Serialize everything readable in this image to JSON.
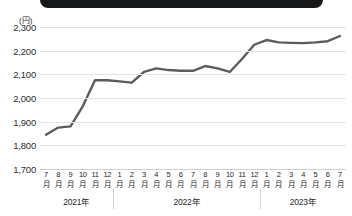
{
  "banner": {
    "name": "title-banner"
  },
  "chart_data": {
    "type": "line",
    "title": "",
    "xlabel": "",
    "ylabel": "",
    "unit_label": "(円)",
    "ylim": [
      1700,
      2300
    ],
    "ytick_step": 100,
    "yticks": [
      "2,300",
      "2,200",
      "2,100",
      "2,000",
      "1,900",
      "1,800",
      "1,700"
    ],
    "ytick_values": [
      2300,
      2200,
      2100,
      2000,
      1900,
      1800,
      1700
    ],
    "grid": true,
    "legend": "none",
    "month_suffix": "月",
    "categories": [
      "7月",
      "8月",
      "9月",
      "10月",
      "11月",
      "12月",
      "1月",
      "2月",
      "3月",
      "4月",
      "5月",
      "6月",
      "7月",
      "8月",
      "9月",
      "10月",
      "11月",
      "12月",
      "1月",
      "2月",
      "3月",
      "4月",
      "5月",
      "6月",
      "7月"
    ],
    "month_numbers": [
      "7",
      "8",
      "9",
      "10",
      "11",
      "12",
      "1",
      "2",
      "3",
      "4",
      "5",
      "6",
      "7",
      "8",
      "9",
      "10",
      "11",
      "12",
      "1",
      "2",
      "3",
      "4",
      "5",
      "6",
      "7"
    ],
    "values": [
      1845,
      1875,
      1880,
      1965,
      2075,
      2075,
      2070,
      2065,
      2110,
      2125,
      2118,
      2115,
      2115,
      2135,
      2125,
      2110,
      2165,
      2225,
      2245,
      2235,
      2233,
      2232,
      2235,
      2240,
      2262
    ],
    "years": [
      {
        "label": "2021年",
        "start_index": 0,
        "end_index": 5
      },
      {
        "label": "2022年",
        "start_index": 6,
        "end_index": 17
      },
      {
        "label": "2023年",
        "start_index": 18,
        "end_index": 24
      }
    ],
    "line_color": "#5c5c5c",
    "grid_color": "#e3e3e3",
    "text_color": "#262626"
  }
}
